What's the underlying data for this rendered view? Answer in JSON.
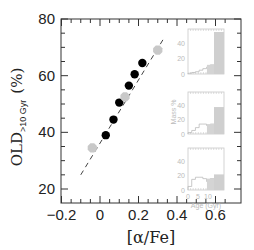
{
  "chart_data": {
    "type": "scatter",
    "title": "",
    "xlabel": "[α/Fe]",
    "ylabel": "OLD>10 Gyr (%)",
    "ylabel_main": "OLD",
    "ylabel_sub": ">10 Gyr",
    "ylabel_unit": "(%)",
    "xlim": [
      -0.2,
      0.65
    ],
    "ylim": [
      20,
      80
    ],
    "xticks": [
      -0.2,
      0,
      0.2,
      0.4,
      0.6
    ],
    "xtick_labels": [
      "−0.2",
      "0",
      "0.2",
      "0.4",
      "0.6"
    ],
    "yticks": [
      20,
      40,
      60,
      80
    ],
    "ytick_labels": [
      "20",
      "40",
      "60",
      "80"
    ],
    "grid": false,
    "series": [
      {
        "name": "black points",
        "color": "#000000",
        "x": [
          0.03,
          0.07,
          0.1,
          0.15,
          0.18,
          0.22
        ],
        "y": [
          39,
          44.5,
          50.5,
          56.5,
          60.5,
          64.5
        ]
      },
      {
        "name": "gray points",
        "color": "#c8c8c8",
        "x": [
          -0.04,
          0.13,
          0.3
        ],
        "y": [
          34.5,
          52.5,
          69
        ]
      }
    ],
    "fit_line": {
      "style": "dashed",
      "x": [
        -0.1,
        0.33
      ],
      "y": [
        25,
        73
      ]
    },
    "inset": {
      "xlabel": "Age (Gyr)",
      "ylabel": "Mass %",
      "xtick_labels": [
        "0",
        "5",
        "10"
      ],
      "panels": [
        {
          "ytick_labels": [
            "0",
            "20",
            "40"
          ],
          "bars": [
            1,
            2,
            3,
            5,
            7,
            9,
            12,
            55
          ]
        },
        {
          "ytick_labels": [
            "0",
            "20",
            "40"
          ],
          "bars": [
            2,
            5,
            9,
            14,
            14,
            12,
            14,
            38
          ]
        },
        {
          "ytick_labels": [
            "0",
            "20",
            "40"
          ],
          "bars": [
            5,
            15,
            18,
            18,
            16,
            12,
            16,
            22
          ]
        }
      ]
    }
  }
}
